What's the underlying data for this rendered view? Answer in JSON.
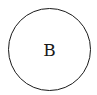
{
  "diagram": {
    "nodes": [
      {
        "id": "B",
        "label": "B",
        "shape": "circle",
        "stroke_color": "#1a1a1a",
        "fill_color": "#ffffff"
      }
    ]
  }
}
